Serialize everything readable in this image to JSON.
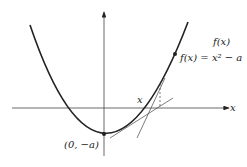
{
  "diagram": {
    "title": "",
    "labels": {
      "curve_name": "f(x)",
      "curve_equation": "f(x) = x² − a",
      "x_point": "x",
      "x_axis": "x",
      "vertex": "(0, −a)"
    },
    "colors": {
      "ink": "#222222",
      "background": "#ffffff"
    }
  }
}
